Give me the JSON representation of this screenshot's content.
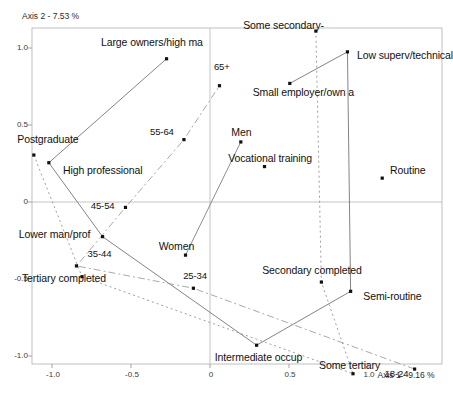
{
  "chart_data": {
    "type": "scatter",
    "title": "",
    "xlabel": "Axis 1 - 9.16 %",
    "ylabel": "Axis 2 - 7.53 %",
    "xlim": [
      -1.25,
      1.35
    ],
    "ylim": [
      -1.22,
      1.18
    ],
    "xticks": [
      -1.0,
      -0.5,
      0,
      0.5,
      1.0
    ],
    "xticklabels": [
      "-1.0",
      "-0.5",
      "0",
      "0.5",
      "1.0"
    ],
    "yticks": [
      1.0,
      0.5,
      0,
      -0.5,
      -1.0
    ],
    "yticklabels": [
      "1.0",
      "0.5",
      "0",
      "-0.5",
      "-1.0"
    ],
    "grid": false,
    "zero_lines": true,
    "legend": "none",
    "series": [
      {
        "name": "Education",
        "color": "#8c8c8c",
        "linestyle": "dotted",
        "points": [
          {
            "label": "Postgraduate",
            "x": -1.115,
            "y": 0.305,
            "lx": -1.22,
            "ly": 0.405
          },
          {
            "label": "Tertiary completed",
            "x": -0.81,
            "y": -0.485,
            "lx": -1.19,
            "ly": -0.5
          },
          {
            "label": "Some tertiary",
            "x": 0.905,
            "y": -1.115,
            "lx": 0.69,
            "ly": -1.065
          },
          {
            "label": "Secondary completed",
            "x": 0.705,
            "y": -0.52,
            "lx": 0.33,
            "ly": -0.45
          },
          {
            "label": "Some secondary-",
            "x": 0.67,
            "y": 1.11,
            "lx": 0.21,
            "ly": 1.145
          }
        ]
      },
      {
        "name": "Occupation",
        "color": "#6e6e6e",
        "linestyle": "solid",
        "points": [
          {
            "label": "Large owners/high ma",
            "x": -0.275,
            "y": 0.93,
            "lx": -0.69,
            "ly": 1.035
          },
          {
            "label": "High professional",
            "x": -1.02,
            "y": 0.255,
            "lx": -0.93,
            "ly": 0.2
          },
          {
            "label": "Lower man/prof",
            "x": -0.68,
            "y": -0.225,
            "lx": -1.21,
            "ly": -0.215
          },
          {
            "label": "Intermediate occup",
            "x": 0.295,
            "y": -0.93,
            "lx": 0.03,
            "ly": -1.015
          },
          {
            "label": "Small employer/own a",
            "x": 0.505,
            "y": 0.77,
            "lx": 0.27,
            "ly": 0.705
          },
          {
            "label": "Low superv/technical",
            "x": 0.87,
            "y": 0.975,
            "lx": 0.93,
            "ly": 0.95
          },
          {
            "label": "Semi-routine",
            "x": 0.89,
            "y": -0.58,
            "lx": 0.97,
            "ly": -0.615
          },
          {
            "label": "Routine",
            "x": 1.09,
            "y": 0.155,
            "lx": 1.14,
            "ly": 0.2
          }
        ]
      },
      {
        "name": "Age",
        "color": "#9a9a9a",
        "linestyle": "dashdot",
        "points": [
          {
            "label": "18-24",
            "x": 1.295,
            "y": -1.085,
            "lx": 1.105,
            "ly": -1.125
          },
          {
            "label": "25-34",
            "x": -0.105,
            "y": -0.56,
            "lx": -0.17,
            "ly": -0.49
          },
          {
            "label": "35-44",
            "x": -0.845,
            "y": -0.415,
            "lx": -0.775,
            "ly": -0.345
          },
          {
            "label": "45-54",
            "x": -0.535,
            "y": -0.035,
            "lx": -0.755,
            "ly": -0.035
          },
          {
            "label": "55-64",
            "x": -0.165,
            "y": 0.405,
            "lx": -0.38,
            "ly": 0.445
          },
          {
            "label": "65+",
            "x": 0.06,
            "y": 0.755,
            "lx": 0.025,
            "ly": 0.87
          }
        ]
      },
      {
        "name": "Gender",
        "color": "#7a7a7a",
        "linestyle": "solid",
        "points": [
          {
            "label": "Men",
            "x": 0.195,
            "y": 0.39,
            "lx": 0.135,
            "ly": 0.45
          },
          {
            "label": "Women",
            "x": -0.155,
            "y": -0.345,
            "lx": -0.325,
            "ly": -0.29
          },
          {
            "label": "Vocational training",
            "x": 0.345,
            "y": 0.23,
            "lx": 0.115,
            "ly": 0.28
          }
        ]
      }
    ],
    "connectors": {
      "occupation_path": [
        "Large owners/high ma",
        "High professional",
        "Lower man/prof",
        "Intermediate occup",
        "Semi-routine",
        "Low superv/technical",
        "Small employer/own a"
      ],
      "education_path": [
        "Postgraduate",
        "Tertiary completed",
        "Some tertiary",
        "Secondary completed",
        "Some secondary-"
      ],
      "age_path": [
        "18-24",
        "25-34",
        "35-44",
        "45-54",
        "55-64",
        "65+"
      ],
      "gender_path": [
        "Men",
        "Women"
      ]
    }
  }
}
